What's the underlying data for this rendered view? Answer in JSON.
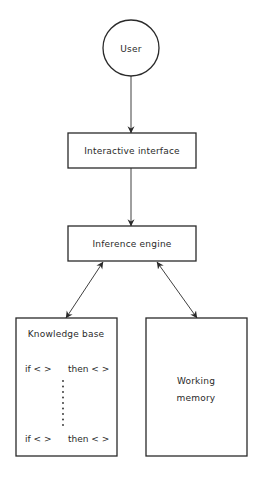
{
  "diagram": {
    "type": "expert-system-architecture",
    "nodes": {
      "user": {
        "label": "User",
        "shape": "circle"
      },
      "interactive_interface": {
        "label": "Interactive interface",
        "shape": "rectangle"
      },
      "inference_engine": {
        "label": "Inference engine",
        "shape": "rectangle"
      },
      "knowledge_base": {
        "label": "Knowledge base",
        "shape": "rectangle",
        "rules": [
          {
            "if": "if < >",
            "then": "then < >"
          },
          {
            "if": "if < >",
            "then": "then < >"
          }
        ],
        "ellipsis": "vertical-dots"
      },
      "working_memory": {
        "label_line1": "Working",
        "label_line2": "memory",
        "shape": "rectangle"
      }
    },
    "edges": [
      {
        "from": "User",
        "to": "Interactive interface",
        "direction": "one-way"
      },
      {
        "from": "Interactive interface",
        "to": "Inference engine",
        "direction": "one-way"
      },
      {
        "from": "Inference engine",
        "to": "Knowledge base",
        "direction": "two-way"
      },
      {
        "from": "Inference engine",
        "to": "Working memory",
        "direction": "two-way"
      }
    ],
    "colors": {
      "line": "#2a2a2a",
      "background": "#ffffff"
    }
  }
}
